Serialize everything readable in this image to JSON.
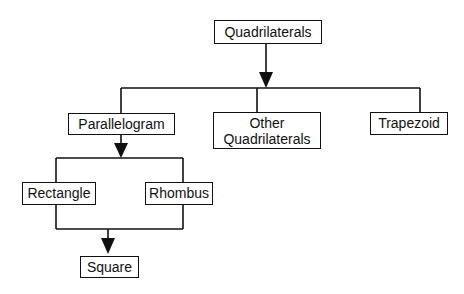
{
  "diagram": {
    "colors": {
      "line": "#111111",
      "background": "#ffffff"
    },
    "nodes": {
      "quadrilaterals": {
        "line1": "Quadrilaterals"
      },
      "parallelogram": {
        "line1": "Parallelogram"
      },
      "other": {
        "line1": "Other",
        "line2": "Quadrilaterals"
      },
      "trapezoid": {
        "line1": "Trapezoid"
      },
      "rectangle": {
        "line1": "Rectangle"
      },
      "rhombus": {
        "line1": "Rhombus"
      },
      "square": {
        "line1": "Square"
      }
    },
    "edges": [
      {
        "from": "Quadrilaterals",
        "to": [
          "Parallelogram",
          "Other Quadrilaterals",
          "Trapezoid"
        ]
      },
      {
        "from": "Parallelogram",
        "to": [
          "Rectangle",
          "Rhombus"
        ]
      },
      {
        "from": [
          "Rectangle",
          "Rhombus"
        ],
        "to": "Square"
      }
    ]
  }
}
